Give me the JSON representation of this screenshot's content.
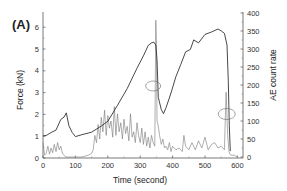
{
  "panel_label": "(A)",
  "chart_data": {
    "type": "line",
    "title": "",
    "panel": "(A)",
    "xlabel": "Time (second)",
    "ylabel_left": "Force (kN)",
    "ylabel_right": "AE count rate",
    "xlim": [
      0,
      620
    ],
    "ylim_left": [
      0,
      6.5
    ],
    "ylim_right": [
      0,
      400
    ],
    "x_ticks": [
      0,
      100,
      200,
      300,
      400,
      500,
      600
    ],
    "y_left_ticks": [
      0,
      1,
      2,
      3,
      4,
      5,
      6
    ],
    "y_right_ticks": [
      0,
      50,
      100,
      150,
      200,
      250,
      300,
      350,
      400
    ],
    "grid": false,
    "legend": null,
    "series": [
      {
        "name": "Force",
        "axis": "left",
        "color": "#333333",
        "x": [
          0,
          10,
          25,
          40,
          55,
          65,
          72,
          80,
          90,
          100,
          120,
          150,
          180,
          200,
          230,
          260,
          290,
          310,
          325,
          335,
          342,
          348,
          352,
          356,
          365,
          372,
          380,
          395,
          410,
          425,
          440,
          455,
          465,
          480,
          500,
          520,
          540,
          550,
          560,
          568,
          572,
          575,
          578
        ],
        "values": [
          1.0,
          1.05,
          1.15,
          1.3,
          1.75,
          1.9,
          2.05,
          1.5,
          1.15,
          1.0,
          1.05,
          1.2,
          1.45,
          1.7,
          2.4,
          3.2,
          4.1,
          4.7,
          5.15,
          5.3,
          5.3,
          5.2,
          4.5,
          2.8,
          2.2,
          2.05,
          2.3,
          3.0,
          3.7,
          4.3,
          4.85,
          5.0,
          5.4,
          5.3,
          5.65,
          5.8,
          5.9,
          5.85,
          5.7,
          5.2,
          3.5,
          1.5,
          0.3
        ]
      },
      {
        "name": "AE count rate",
        "axis": "right",
        "color": "#777777",
        "x": [
          0,
          5,
          10,
          15,
          20,
          25,
          30,
          35,
          40,
          45,
          50,
          55,
          60,
          65,
          70,
          80,
          100,
          120,
          140,
          150,
          155,
          160,
          165,
          170,
          175,
          180,
          185,
          190,
          195,
          200,
          205,
          210,
          215,
          220,
          225,
          230,
          235,
          240,
          245,
          250,
          255,
          260,
          265,
          270,
          275,
          280,
          285,
          290,
          295,
          300,
          305,
          310,
          315,
          320,
          325,
          330,
          335,
          340,
          345,
          348,
          350,
          352,
          355,
          360,
          365,
          370,
          375,
          380,
          385,
          390,
          395,
          400,
          410,
          420,
          430,
          435,
          440,
          450,
          460,
          470,
          480,
          490,
          500,
          510,
          520,
          530,
          540,
          550,
          560,
          565,
          570,
          574,
          576,
          580,
          590,
          600
        ],
        "values": [
          40,
          5,
          10,
          30,
          8,
          25,
          12,
          35,
          15,
          40,
          20,
          30,
          10,
          5,
          0,
          0,
          0,
          0,
          5,
          10,
          20,
          60,
          40,
          90,
          50,
          110,
          70,
          130,
          60,
          115,
          80,
          100,
          55,
          140,
          60,
          120,
          70,
          95,
          50,
          105,
          65,
          85,
          45,
          120,
          55,
          70,
          40,
          95,
          60,
          40,
          80,
          35,
          70,
          30,
          55,
          25,
          60,
          40,
          30,
          380,
          320,
          100,
          90,
          60,
          35,
          50,
          25,
          30,
          20,
          40,
          15,
          30,
          20,
          25,
          15,
          60,
          30,
          20,
          40,
          20,
          45,
          25,
          55,
          20,
          35,
          40,
          25,
          30,
          20,
          180,
          60,
          15,
          10,
          5,
          5,
          0
        ]
      }
    ],
    "annotations": [
      {
        "type": "ellipse",
        "near_time": 350,
        "near_force": 2.2,
        "description": "circle marking sudden force drop at ~350 s"
      },
      {
        "type": "ellipse",
        "near_time": 575,
        "near_ae": 120,
        "description": "circle marking AE spike near ~575 s"
      }
    ]
  }
}
